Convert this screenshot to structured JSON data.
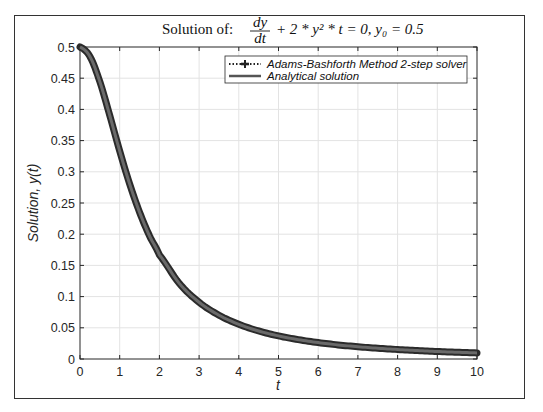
{
  "chart_data": {
    "type": "line",
    "title_parts": {
      "prefix": "Solution of:",
      "frac_num": "dy",
      "frac_den": "dt",
      "rest": "+ 2 * y² * t = 0, y₀ = 0.5"
    },
    "xlabel": "t",
    "ylabel": "Solution, y(t)",
    "xlim": [
      0,
      10
    ],
    "ylim": [
      0,
      0.5
    ],
    "xticks": [
      0,
      1,
      2,
      3,
      4,
      5,
      6,
      7,
      8,
      9,
      10
    ],
    "xtick_labels": [
      "0",
      "1",
      "2",
      "3",
      "4",
      "5",
      "6",
      "7",
      "8",
      "9",
      "10"
    ],
    "yticks": [
      0,
      0.05,
      0.1,
      0.15,
      0.2,
      0.25,
      0.3,
      0.35,
      0.4,
      0.45,
      0.5
    ],
    "ytick_labels": [
      "0",
      "0.05",
      "0.1",
      "0.15",
      "0.2",
      "0.25",
      "0.3",
      "0.35",
      "0.4",
      "0.45",
      "0.5"
    ],
    "grid": true,
    "legend_position": "northeast",
    "legend": [
      {
        "label": "Adams-Bashforth Method 2-step solver",
        "style": "dotted-plus",
        "color": "#222222"
      },
      {
        "label": "Analytical solution",
        "style": "solid",
        "color": "#555555"
      }
    ],
    "series": [
      {
        "name": "Adams-Bashforth Method 2-step solver",
        "x": [
          0,
          0.25,
          0.5,
          0.75,
          1,
          1.25,
          1.5,
          1.75,
          2,
          2.5,
          3,
          3.5,
          4,
          4.5,
          5,
          5.5,
          6,
          6.5,
          7,
          7.5,
          8,
          8.5,
          9,
          9.5,
          10
        ],
        "values": [
          0.5,
          0.4848,
          0.4444,
          0.3902,
          0.3333,
          0.2807,
          0.2353,
          0.1975,
          0.1667,
          0.1212,
          0.0909,
          0.0702,
          0.0556,
          0.0449,
          0.037,
          0.031,
          0.0263,
          0.0226,
          0.0196,
          0.0172,
          0.0152,
          0.0135,
          0.012,
          0.0108,
          0.0098
        ]
      },
      {
        "name": "Analytical solution",
        "x": [
          0,
          0.25,
          0.5,
          0.75,
          1,
          1.25,
          1.5,
          1.75,
          2,
          2.5,
          3,
          3.5,
          4,
          4.5,
          5,
          5.5,
          6,
          6.5,
          7,
          7.5,
          8,
          8.5,
          9,
          9.5,
          10
        ],
        "values": [
          0.5,
          0.4848,
          0.4444,
          0.3902,
          0.3333,
          0.2807,
          0.2353,
          0.1975,
          0.1667,
          0.1212,
          0.0909,
          0.0702,
          0.0556,
          0.0449,
          0.037,
          0.031,
          0.0263,
          0.0226,
          0.0196,
          0.0172,
          0.0152,
          0.0135,
          0.012,
          0.0108,
          0.0098
        ]
      }
    ],
    "colors": {
      "axis": "#262626",
      "grid": "#e3e3e3",
      "curve_outer": "#2b2b2b",
      "curve_inner": "#6a6a6a",
      "frame": "#333333"
    }
  }
}
